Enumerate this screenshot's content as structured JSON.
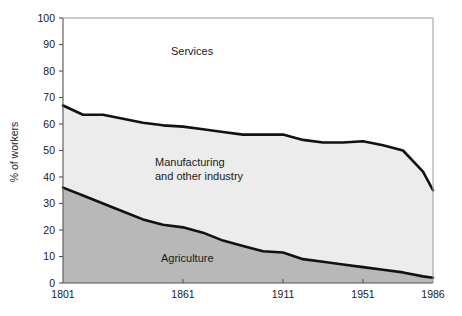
{
  "chart_data": {
    "type": "area",
    "title": "",
    "subtitle": "",
    "xlabel": "",
    "ylabel": "% of workers",
    "xlim": [
      1801,
      1986
    ],
    "ylim": [
      0,
      100
    ],
    "grid": false,
    "legend_position": "inline-annotations",
    "stacked": true,
    "x_tick_labels": [
      "1801",
      "1861",
      "1911",
      "1951",
      "1986"
    ],
    "x_ticks": [
      1801,
      1861,
      1911,
      1951,
      1986
    ],
    "y_tick_labels": [
      "0",
      "10",
      "20",
      "30",
      "40",
      "50",
      "60",
      "70",
      "80",
      "90",
      "100"
    ],
    "y_ticks": [
      0,
      10,
      20,
      30,
      40,
      50,
      60,
      70,
      80,
      90,
      100
    ],
    "annotations": [
      {
        "text": "Services",
        "x": 1855,
        "y": 86
      },
      {
        "text": "Manufacturing",
        "x": 1847,
        "y": 44
      },
      {
        "text": "and other industry",
        "x": 1847,
        "y": 39
      },
      {
        "text": "Agriculture",
        "x": 1850,
        "y": 8
      }
    ],
    "series": [
      {
        "name": "Agriculture",
        "color": "#b8b8b8",
        "x": [
          1801,
          1811,
          1821,
          1831,
          1841,
          1851,
          1861,
          1871,
          1881,
          1891,
          1901,
          1911,
          1921,
          1931,
          1941,
          1951,
          1961,
          1971,
          1981,
          1986
        ],
        "values": [
          36,
          33,
          30,
          27,
          24,
          22,
          21,
          19,
          16,
          14,
          12,
          11.5,
          9,
          8,
          7,
          6,
          5,
          4,
          2.5,
          2
        ]
      },
      {
        "name": "Manufacturing and other industry",
        "color": "#ececec",
        "x": [
          1801,
          1811,
          1821,
          1831,
          1841,
          1851,
          1861,
          1871,
          1881,
          1891,
          1901,
          1911,
          1921,
          1931,
          1941,
          1951,
          1961,
          1971,
          1981,
          1986
        ],
        "values": [
          31,
          30.5,
          33.5,
          35,
          36.5,
          37.5,
          38,
          39,
          41,
          42,
          44,
          44.5,
          45,
          45,
          46,
          47.5,
          47,
          46,
          39.5,
          33
        ]
      },
      {
        "name": "Services",
        "color": "#ffffff",
        "x": [
          1801,
          1811,
          1821,
          1831,
          1841,
          1851,
          1861,
          1871,
          1881,
          1891,
          1901,
          1911,
          1921,
          1931,
          1941,
          1951,
          1961,
          1971,
          1981,
          1986
        ],
        "values": [
          33,
          36.5,
          36.5,
          38,
          39.5,
          40.5,
          41,
          42,
          43,
          44,
          44,
          44,
          46,
          47,
          47,
          46.5,
          48,
          50,
          58,
          65
        ]
      }
    ],
    "cumulative_upper_boundary": {
      "name": "Agriculture + Manufacturing (top of industry band)",
      "x": [
        1801,
        1811,
        1821,
        1831,
        1841,
        1851,
        1861,
        1871,
        1881,
        1891,
        1901,
        1911,
        1921,
        1931,
        1941,
        1951,
        1961,
        1971,
        1981,
        1986
      ],
      "values": [
        67,
        63.5,
        63.5,
        62,
        60.5,
        59.5,
        59,
        58,
        57,
        56,
        56,
        56,
        54,
        53,
        53,
        53.5,
        52,
        50,
        42,
        35
      ]
    }
  }
}
